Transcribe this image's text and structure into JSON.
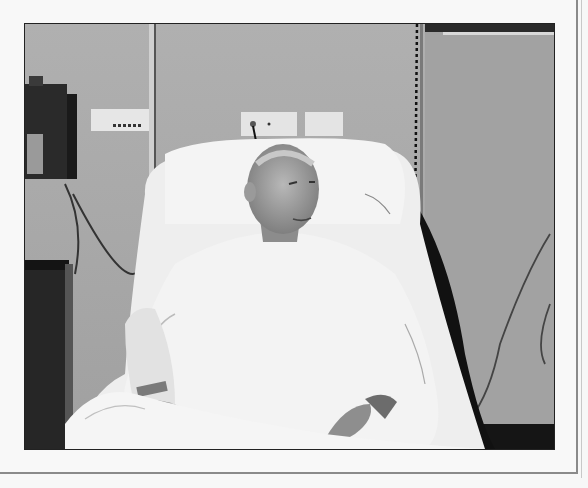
{
  "image": {
    "description": "Black-and-white photograph of an elderly man sitting upright in a hospital bed wearing a white gown, with IV tubing and medical equipment on the wall",
    "palette": {
      "wall": "#a8a8a8",
      "wall_right": "#9c9c9c",
      "sheets": "#f2f2f2",
      "shadow": "#141414",
      "equipment": "#2a2a2a",
      "frame_border": "#8a8a8a",
      "page_bg": "#f7f7f7"
    },
    "elements": [
      "wall-mounted monitor (left)",
      "wall outlet panel (left)",
      "IV pole",
      "two wall outlets (center)",
      "pillow",
      "man's head and face",
      "white hospital gown",
      "bed with white sheets",
      "coiled cord (right)",
      "hanging cables (right)",
      "bedside cabinet (left)",
      "hospital wristband"
    ]
  }
}
